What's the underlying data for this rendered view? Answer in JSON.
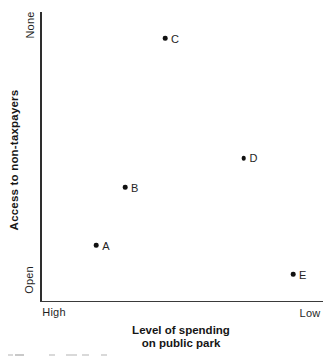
{
  "chart_data": {
    "type": "scatter",
    "title": "",
    "ylabel": "Access to non-taxpayers",
    "xlabel_lines": [
      "Level of spending",
      "on public park"
    ],
    "y_axis": {
      "top_label": "None",
      "bottom_label": "Open"
    },
    "x_axis": {
      "left_label": "High",
      "right_label": "Low"
    },
    "axis_note": "x runs qualitatively from High spending (left) to Low spending (right); y runs from Open access (bottom) to None (top); no numeric scale shown",
    "points": [
      {
        "label": "A",
        "x": 0.197,
        "y": 0.193
      },
      {
        "label": "B",
        "x": 0.299,
        "y": 0.394
      },
      {
        "label": "C",
        "x": 0.441,
        "y": 0.91
      },
      {
        "label": "D",
        "x": 0.719,
        "y": 0.495
      },
      {
        "label": "E",
        "x": 0.894,
        "y": 0.093
      }
    ],
    "colors": {
      "point": "#111111",
      "axis": "#333333",
      "text": "#1f1f1f",
      "background": "#ffffff"
    },
    "legend": "none",
    "grid": false
  }
}
